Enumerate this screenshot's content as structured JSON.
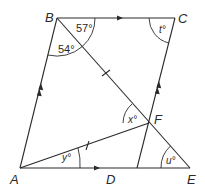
{
  "diagram": {
    "points": {
      "A": "A",
      "B": "B",
      "C": "C",
      "D": "D",
      "E": "E",
      "F": "F"
    },
    "angles": {
      "angle_CBF": "57°",
      "angle_ABF": "54°",
      "angle_C": "t°",
      "angle_F": "x°",
      "angle_A": "y°",
      "angle_E": "u°"
    }
  }
}
